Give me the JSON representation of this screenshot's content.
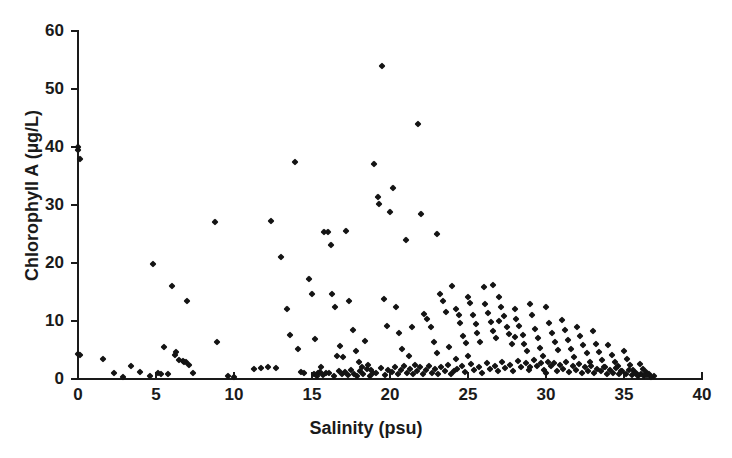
{
  "chart_data": {
    "type": "scatter",
    "title": "",
    "xlabel": "Salinity (psu)",
    "ylabel": "Chlorophyll A (µg/L)",
    "xlim": [
      0,
      40
    ],
    "ylim": [
      0,
      60
    ],
    "xticks": [
      0,
      5,
      10,
      15,
      20,
      25,
      30,
      35,
      40
    ],
    "yticks": [
      0,
      10,
      20,
      30,
      40,
      50,
      60
    ],
    "xtick_labels": [
      "0",
      "5",
      "10",
      "15",
      "20",
      "25",
      "30",
      "35",
      "40"
    ],
    "ytick_labels": [
      "0",
      "10",
      "20",
      "30",
      "40",
      "50",
      "60"
    ],
    "grid": false,
    "legend": null,
    "marker": "diamond",
    "marker_color": "#141414",
    "marker_size_px": 5,
    "series": [
      {
        "name": "Chlorophyll A vs Salinity",
        "points": [
          [
            0.0,
            40.0
          ],
          [
            0.0,
            39.4
          ],
          [
            0.1,
            38.0
          ],
          [
            0.0,
            4.3
          ],
          [
            0.1,
            4.2
          ],
          [
            1.6,
            3.4
          ],
          [
            2.3,
            1.0
          ],
          [
            2.9,
            0.4
          ],
          [
            3.4,
            2.2
          ],
          [
            4.0,
            1.2
          ],
          [
            4.6,
            0.5
          ],
          [
            4.8,
            19.9
          ],
          [
            5.1,
            1.0
          ],
          [
            5.3,
            0.8
          ],
          [
            5.5,
            5.6
          ],
          [
            5.8,
            0.9
          ],
          [
            6.0,
            16.0
          ],
          [
            6.2,
            4.1
          ],
          [
            6.3,
            4.6
          ],
          [
            6.5,
            3.2
          ],
          [
            6.7,
            3.1
          ],
          [
            6.8,
            3.0
          ],
          [
            6.9,
            2.9
          ],
          [
            7.0,
            13.5
          ],
          [
            7.1,
            2.4
          ],
          [
            7.4,
            1.0
          ],
          [
            8.8,
            27.0
          ],
          [
            8.9,
            6.4
          ],
          [
            9.6,
            0.6
          ],
          [
            10.0,
            0.3
          ],
          [
            11.3,
            1.8
          ],
          [
            11.7,
            1.9
          ],
          [
            12.2,
            2.0
          ],
          [
            12.4,
            27.2
          ],
          [
            12.7,
            1.9
          ],
          [
            13.0,
            21.0
          ],
          [
            13.4,
            12.0
          ],
          [
            13.6,
            7.6
          ],
          [
            13.9,
            37.5
          ],
          [
            14.1,
            5.2
          ],
          [
            14.3,
            1.2
          ],
          [
            14.5,
            1.1
          ],
          [
            14.8,
            17.3
          ],
          [
            15.0,
            14.7
          ],
          [
            15.2,
            6.9
          ],
          [
            15.4,
            1.0
          ],
          [
            15.6,
            2.0
          ],
          [
            15.8,
            25.3
          ],
          [
            16.0,
            25.3
          ],
          [
            16.2,
            23.1
          ],
          [
            16.3,
            14.7
          ],
          [
            16.5,
            12.4
          ],
          [
            16.6,
            3.9
          ],
          [
            16.8,
            5.7
          ],
          [
            17.0,
            3.8
          ],
          [
            17.2,
            25.5
          ],
          [
            17.4,
            13.4
          ],
          [
            17.6,
            8.5
          ],
          [
            17.8,
            4.8
          ],
          [
            18.0,
            3.0
          ],
          [
            18.2,
            2.0
          ],
          [
            18.4,
            6.6
          ],
          [
            18.6,
            2.5
          ],
          [
            18.8,
            1.6
          ],
          [
            19.0,
            37.0
          ],
          [
            19.2,
            31.3
          ],
          [
            19.3,
            30.1
          ],
          [
            19.5,
            54.0
          ],
          [
            19.6,
            13.8
          ],
          [
            19.8,
            9.2
          ],
          [
            20.0,
            28.8
          ],
          [
            20.2,
            33.0
          ],
          [
            20.4,
            12.4
          ],
          [
            20.6,
            8.0
          ],
          [
            20.8,
            5.1
          ],
          [
            21.0,
            24.0
          ],
          [
            21.2,
            4.0
          ],
          [
            21.4,
            9.0
          ],
          [
            21.6,
            2.4
          ],
          [
            21.8,
            44.0
          ],
          [
            22.0,
            28.4
          ],
          [
            22.2,
            11.2
          ],
          [
            22.4,
            10.4
          ],
          [
            22.6,
            9.0
          ],
          [
            22.8,
            6.4
          ],
          [
            23.0,
            25.0
          ],
          [
            23.2,
            14.6
          ],
          [
            23.4,
            13.5
          ],
          [
            23.6,
            11.6
          ],
          [
            23.8,
            5.6
          ],
          [
            24.0,
            16.0
          ],
          [
            24.2,
            12.0
          ],
          [
            24.4,
            11.0
          ],
          [
            24.5,
            9.6
          ],
          [
            24.7,
            7.5
          ],
          [
            24.9,
            6.2
          ],
          [
            25.0,
            14.2
          ],
          [
            25.1,
            13.1
          ],
          [
            25.3,
            11.0
          ],
          [
            25.5,
            9.4
          ],
          [
            25.6,
            8.0
          ],
          [
            25.8,
            6.3
          ],
          [
            26.0,
            15.8
          ],
          [
            26.1,
            13.0
          ],
          [
            26.3,
            11.4
          ],
          [
            26.5,
            9.9
          ],
          [
            26.6,
            8.2
          ],
          [
            26.8,
            7.0
          ],
          [
            27.0,
            14.2
          ],
          [
            27.1,
            12.4
          ],
          [
            27.3,
            10.8
          ],
          [
            27.5,
            9.0
          ],
          [
            27.6,
            7.8
          ],
          [
            27.8,
            6.1
          ],
          [
            28.0,
            12.0
          ],
          [
            28.1,
            10.4
          ],
          [
            28.3,
            9.2
          ],
          [
            28.5,
            7.6
          ],
          [
            28.6,
            6.0
          ],
          [
            28.8,
            4.8
          ],
          [
            29.0,
            13.0
          ],
          [
            29.1,
            11.0
          ],
          [
            29.3,
            8.6
          ],
          [
            29.5,
            7.0
          ],
          [
            29.6,
            5.4
          ],
          [
            29.8,
            4.0
          ],
          [
            30.0,
            12.5
          ],
          [
            30.2,
            9.6
          ],
          [
            30.4,
            8.0
          ],
          [
            30.6,
            6.4
          ],
          [
            30.8,
            5.0
          ],
          [
            31.0,
            10.2
          ],
          [
            31.2,
            8.4
          ],
          [
            31.4,
            6.8
          ],
          [
            31.6,
            5.2
          ],
          [
            31.8,
            3.8
          ],
          [
            32.0,
            9.0
          ],
          [
            32.2,
            7.4
          ],
          [
            32.4,
            5.8
          ],
          [
            32.6,
            4.4
          ],
          [
            32.8,
            3.0
          ],
          [
            33.0,
            8.2
          ],
          [
            33.2,
            6.0
          ],
          [
            33.4,
            4.6
          ],
          [
            33.6,
            3.2
          ],
          [
            33.8,
            2.0
          ],
          [
            34.0,
            5.8
          ],
          [
            34.2,
            4.2
          ],
          [
            34.4,
            3.0
          ],
          [
            34.6,
            2.2
          ],
          [
            34.8,
            1.4
          ],
          [
            35.0,
            4.8
          ],
          [
            35.2,
            3.4
          ],
          [
            35.4,
            2.4
          ],
          [
            35.6,
            1.6
          ],
          [
            35.8,
            1.0
          ],
          [
            36.0,
            2.6
          ],
          [
            36.2,
            1.8
          ],
          [
            36.4,
            1.2
          ],
          [
            36.6,
            0.8
          ],
          [
            36.9,
            0.5
          ],
          [
            23.9,
            0.9
          ],
          [
            24.1,
            1.4
          ],
          [
            24.3,
            1.8
          ],
          [
            24.6,
            2.2
          ],
          [
            24.8,
            1.2
          ],
          [
            25.2,
            2.6
          ],
          [
            25.4,
            1.5
          ],
          [
            25.7,
            2.0
          ],
          [
            25.9,
            1.1
          ],
          [
            26.2,
            2.8
          ],
          [
            26.4,
            1.7
          ],
          [
            26.7,
            2.3
          ],
          [
            26.9,
            1.3
          ],
          [
            27.2,
            2.9
          ],
          [
            27.4,
            1.9
          ],
          [
            27.7,
            2.5
          ],
          [
            27.9,
            1.4
          ],
          [
            28.2,
            3.1
          ],
          [
            28.4,
            2.1
          ],
          [
            28.7,
            2.7
          ],
          [
            28.9,
            1.5
          ],
          [
            29.2,
            3.2
          ],
          [
            29.4,
            2.3
          ],
          [
            29.7,
            2.8
          ],
          [
            29.9,
            1.6
          ],
          [
            30.1,
            3.0
          ],
          [
            30.3,
            2.2
          ],
          [
            30.5,
            2.7
          ],
          [
            30.7,
            1.3
          ],
          [
            30.9,
            2.4
          ],
          [
            31.1,
            1.8
          ],
          [
            31.3,
            2.9
          ],
          [
            31.5,
            1.2
          ],
          [
            31.7,
            2.2
          ],
          [
            31.9,
            1.5
          ],
          [
            32.1,
            2.6
          ],
          [
            32.3,
            1.1
          ],
          [
            32.5,
            2.0
          ],
          [
            32.7,
            1.4
          ],
          [
            32.9,
            2.3
          ],
          [
            33.1,
            1.0
          ],
          [
            33.3,
            1.8
          ],
          [
            33.5,
            1.3
          ],
          [
            33.7,
            2.1
          ],
          [
            33.9,
            0.9
          ],
          [
            34.1,
            1.6
          ],
          [
            34.3,
            1.1
          ],
          [
            34.5,
            1.9
          ],
          [
            34.7,
            0.8
          ],
          [
            34.9,
            1.3
          ],
          [
            35.1,
            0.9
          ],
          [
            35.3,
            1.5
          ],
          [
            35.5,
            0.7
          ],
          [
            35.7,
            1.1
          ],
          [
            35.9,
            0.6
          ],
          [
            36.1,
            0.9
          ],
          [
            36.3,
            0.5
          ],
          [
            36.5,
            0.7
          ],
          [
            36.7,
            0.4
          ],
          [
            22.1,
            0.8
          ],
          [
            22.3,
            1.5
          ],
          [
            22.5,
            2.2
          ],
          [
            22.7,
            1.1
          ],
          [
            22.9,
            1.8
          ],
          [
            23.1,
            0.9
          ],
          [
            23.3,
            2.0
          ],
          [
            23.5,
            1.3
          ],
          [
            23.7,
            2.4
          ],
          [
            21.1,
            1.0
          ],
          [
            21.3,
            1.7
          ],
          [
            21.5,
            0.8
          ],
          [
            21.7,
            1.4
          ],
          [
            21.9,
            2.1
          ],
          [
            20.1,
            1.2
          ],
          [
            20.3,
            2.0
          ],
          [
            20.5,
            0.9
          ],
          [
            20.7,
            1.6
          ],
          [
            20.9,
            2.3
          ],
          [
            19.1,
            1.1
          ],
          [
            19.4,
            1.9
          ],
          [
            19.7,
            0.7
          ],
          [
            19.9,
            1.5
          ],
          [
            18.1,
            1.3
          ],
          [
            18.3,
            0.9
          ],
          [
            18.5,
            1.7
          ],
          [
            18.7,
            0.6
          ],
          [
            18.9,
            1.0
          ],
          [
            17.1,
            1.2
          ],
          [
            17.3,
            0.7
          ],
          [
            17.5,
            1.5
          ],
          [
            17.7,
            0.9
          ],
          [
            17.9,
            0.5
          ],
          [
            16.1,
            1.0
          ],
          [
            16.4,
            0.6
          ],
          [
            16.7,
            1.3
          ],
          [
            16.9,
            0.8
          ],
          [
            15.1,
            0.9
          ],
          [
            15.3,
            0.5
          ],
          [
            15.5,
            1.2
          ],
          [
            15.7,
            0.7
          ],
          [
            15.9,
            1.0
          ],
          [
            26.6,
            16.2
          ],
          [
            27.0,
            10.0
          ],
          [
            28.0,
            7.2
          ],
          [
            24.2,
            3.5
          ],
          [
            23.0,
            4.4
          ],
          [
            25.0,
            4.0
          ],
          [
            29.0,
            2.0
          ],
          [
            30.0,
            1.0
          ]
        ]
      }
    ]
  },
  "axes": {
    "y_title": "Chlorophyll A (µg/L)",
    "x_title": "Salinity (psu)"
  }
}
